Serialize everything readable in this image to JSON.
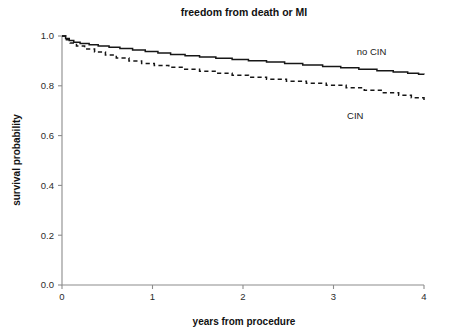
{
  "chart_data": {
    "type": "line",
    "title": "freedom from death or MI",
    "xlabel": "years from procedure",
    "ylabel": "survival probability",
    "xlim": [
      0,
      4
    ],
    "ylim": [
      0,
      1.0
    ],
    "xticks": [
      "0",
      "1",
      "2",
      "3",
      "4"
    ],
    "xtick_values": [
      0,
      1,
      2,
      3,
      4
    ],
    "yticks": [
      "0.0",
      "0.2",
      "0.4",
      "0.6",
      "0.8",
      "1.0"
    ],
    "ytick_values": [
      0.0,
      0.2,
      0.4,
      0.6,
      0.8,
      1.0
    ],
    "grid": false,
    "legend_position": "inline-annotation",
    "series": [
      {
        "name": "no CIN",
        "style": "solid",
        "label_x": 3.42,
        "label_y": 0.925,
        "step": true,
        "x": [
          0.0,
          0.04,
          0.08,
          0.13,
          0.2,
          0.3,
          0.4,
          0.52,
          0.64,
          0.78,
          0.92,
          1.06,
          1.2,
          1.36,
          1.52,
          1.7,
          1.88,
          2.06,
          2.26,
          2.46,
          2.66,
          2.88,
          3.08,
          3.28,
          3.48,
          3.66,
          3.82,
          3.94,
          4.0
        ],
        "y": [
          1.0,
          0.99,
          0.982,
          0.975,
          0.97,
          0.965,
          0.96,
          0.955,
          0.95,
          0.944,
          0.938,
          0.932,
          0.926,
          0.921,
          0.916,
          0.911,
          0.906,
          0.901,
          0.896,
          0.89,
          0.884,
          0.878,
          0.872,
          0.866,
          0.86,
          0.855,
          0.85,
          0.846,
          0.845
        ]
      },
      {
        "name": "CIN",
        "style": "dashed",
        "label_x": 3.24,
        "label_y": 0.665,
        "step": true,
        "x": [
          0.0,
          0.04,
          0.09,
          0.16,
          0.25,
          0.36,
          0.48,
          0.6,
          0.74,
          0.88,
          1.02,
          1.18,
          1.34,
          1.52,
          1.7,
          1.88,
          2.06,
          2.26,
          2.48,
          2.7,
          2.92,
          3.14,
          3.34,
          3.54,
          3.72,
          3.86,
          4.0
        ],
        "y": [
          1.0,
          0.985,
          0.972,
          0.96,
          0.948,
          0.936,
          0.924,
          0.912,
          0.9,
          0.89,
          0.882,
          0.874,
          0.866,
          0.858,
          0.85,
          0.842,
          0.834,
          0.826,
          0.818,
          0.81,
          0.802,
          0.792,
          0.782,
          0.772,
          0.762,
          0.752,
          0.74
        ]
      }
    ]
  },
  "axes_geometry": {
    "left": 62,
    "right": 424,
    "top": 36,
    "bottom": 285,
    "tick_length": 4,
    "title_x": 244,
    "title_y": 16,
    "xlabel_x": 244,
    "xlabel_y": 325,
    "ylabel_x": 20,
    "ylabel_y": 160
  },
  "colors": {
    "axis": "#8c8c8c",
    "curve": "#161616",
    "text": "#1a1a1a",
    "background": "#ffffff"
  }
}
